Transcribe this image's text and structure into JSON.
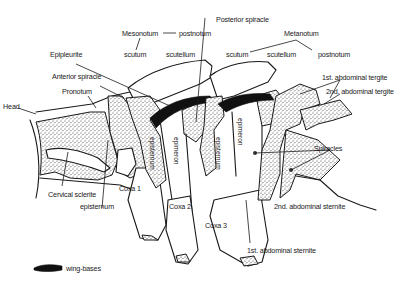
{
  "diagram": {
    "type": "insect-thorax-lateral-view",
    "legend": {
      "symbol": "black-shape",
      "label": "wing-bases",
      "color": "#111111"
    },
    "labels": {
      "head": "Head",
      "pronotum": "Pronotum",
      "anterior_spiracle": "Anterior spiracle",
      "epipleurite": "Epipleurite",
      "mesonotum": "Mesonotum",
      "meso_postnotum": "postnotum",
      "meso_scutum": "scutum",
      "meso_scutellum": "scutellum",
      "posterior_spiracle": "Posterior spiracle",
      "metanotum": "Metanotum",
      "meta_scutum": "scutum",
      "meta_scutellum": "scutellum",
      "meta_postnotum": "postnotum",
      "abd_tergite_1": "1st. abdominal tergite",
      "abd_tergite_2": "2nd. abdominal tergite",
      "spiracles": "Spiracles",
      "abd_sternite_2": "2nd. abdominal sternite",
      "abd_sternite_1": "1st. abdominal sternite",
      "cervical_sclerite": "Cervical sclerite",
      "episternum_pro": "episternum",
      "episternum_meso": "episternum",
      "epimeron_meso": "epimeron",
      "episternum_meta": "episternum",
      "epimeron_meta": "epimeron",
      "coxa1": "Coxa 1",
      "coxa2": "Coxa 2",
      "coxa3": "Coxa 3"
    }
  }
}
